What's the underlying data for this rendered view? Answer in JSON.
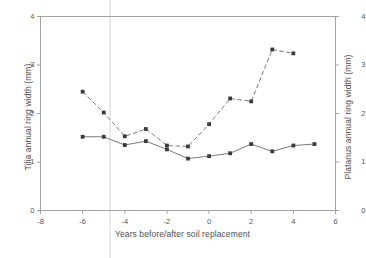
{
  "chart_data": {
    "type": "line",
    "title": "",
    "xlabel": "Years before/after soil replacement",
    "ylabel": "Tilia annual ring width (mm)",
    "ylabel_right": "Platanus annual ring width (mm)",
    "xlim": [
      -8,
      6
    ],
    "ylim": [
      0,
      4
    ],
    "ylim_right": [
      0,
      4
    ],
    "xticks": [
      -8,
      -6,
      -4,
      -2,
      0,
      2,
      4,
      6
    ],
    "xticklabels": [
      "-8",
      "-6",
      "-4",
      "-2",
      "0",
      "2",
      "4",
      "6"
    ],
    "yticks": [
      0,
      1,
      2,
      3,
      4
    ],
    "yticklabels": [
      "0",
      "1",
      "2",
      "3",
      "4"
    ],
    "yticks_right": [
      0,
      1,
      2,
      3,
      4
    ],
    "yticklabels_right": [
      "0",
      "1",
      "2",
      "3",
      "4"
    ],
    "grid": false,
    "legend": "none",
    "marker": "filled-square",
    "series": [
      {
        "name": "Tilia annual ring width (mm)",
        "axis": "left",
        "linestyle": "solid",
        "color": "#4a4a4a",
        "x": [
          -6,
          -5,
          -4,
          -3,
          -2,
          -1,
          0,
          1,
          2,
          3,
          4,
          5
        ],
        "values": [
          1.52,
          1.52,
          1.35,
          1.43,
          1.26,
          1.07,
          1.12,
          1.18,
          1.37,
          1.22,
          1.34,
          1.37
        ]
      },
      {
        "name": "Platanus annual ring width (mm)",
        "axis": "right",
        "linestyle": "dashed",
        "color": "#4a4a4a",
        "x": [
          -6,
          -5,
          -4,
          -3,
          -2,
          -1,
          0,
          1,
          2,
          3,
          4
        ],
        "values": [
          2.45,
          2.02,
          1.53,
          1.68,
          1.34,
          1.32,
          1.78,
          2.31,
          2.25,
          3.32,
          3.24
        ]
      }
    ],
    "annotations": [
      {
        "name": "soil-replacement-marker",
        "type": "vertical-line",
        "x": -4.7
      }
    ]
  },
  "plot": {
    "frame_color": "#9a9a9a",
    "marker_color": "#3a3a3a",
    "line_color": "#6b6b6b"
  }
}
